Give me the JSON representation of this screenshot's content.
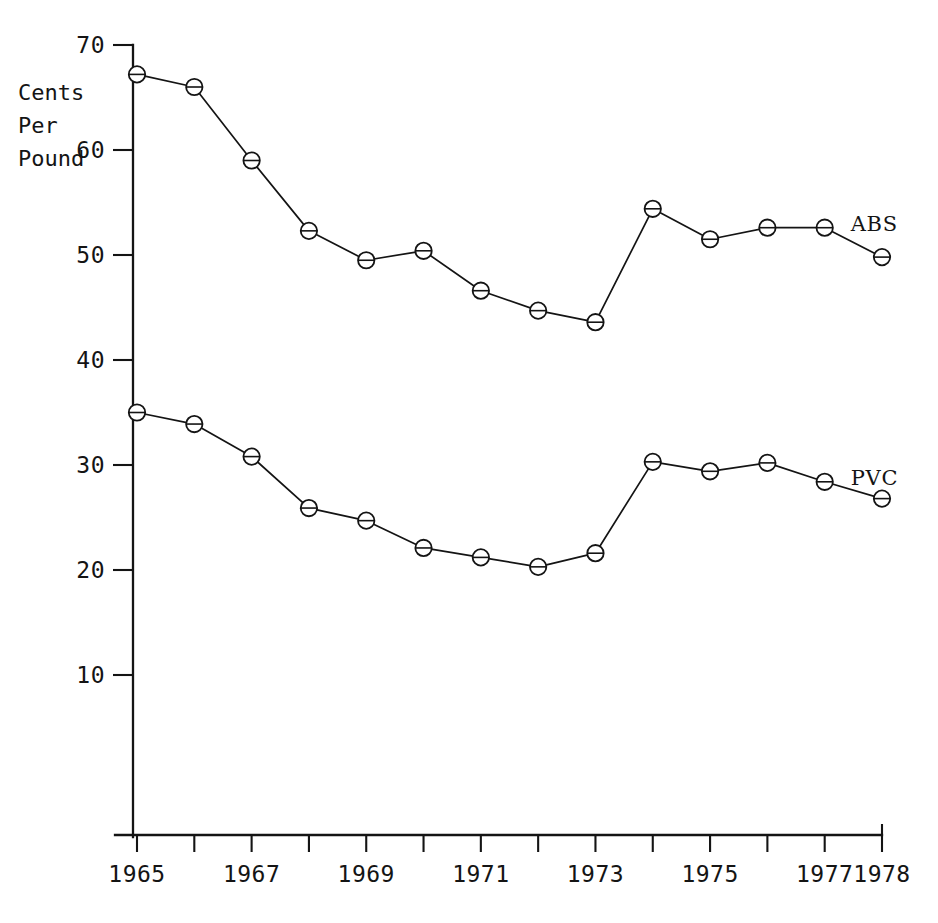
{
  "chart_data": {
    "type": "line",
    "title": "",
    "subtitle": "",
    "xlabel": "",
    "ylabel": "Cents Per Pound",
    "ylabel_lines": [
      "Cents",
      "Per",
      "Pound"
    ],
    "x": [
      1965,
      1966,
      1967,
      1968,
      1969,
      1970,
      1971,
      1972,
      1973,
      1974,
      1975,
      1976,
      1977,
      1978
    ],
    "xtick_labels": [
      "1965",
      "",
      "1967",
      "",
      "1969",
      "",
      "1971",
      "",
      "1973",
      "",
      "1975",
      "",
      "1977",
      "1978"
    ],
    "ytick_labels": [
      "10",
      "20",
      "30",
      "40",
      "50",
      "60",
      "70"
    ],
    "yticks": [
      10,
      20,
      30,
      40,
      50,
      60,
      70
    ],
    "ylim": [
      0,
      70
    ],
    "xlim": [
      1965,
      1978
    ],
    "grid": false,
    "legend_position": "inline-right",
    "series": [
      {
        "name": "ABS",
        "label": "ABS",
        "color": "#141414",
        "values": [
          67.2,
          66.0,
          59.0,
          52.3,
          49.5,
          50.4,
          46.6,
          44.7,
          43.6,
          54.4,
          51.5,
          52.6,
          52.6,
          49.8
        ]
      },
      {
        "name": "PVC",
        "label": "PVC",
        "color": "#141414",
        "values": [
          35.0,
          33.9,
          30.8,
          25.9,
          24.7,
          22.1,
          21.2,
          20.3,
          21.6,
          30.3,
          29.4,
          30.2,
          28.4,
          26.8
        ]
      }
    ],
    "annotations": []
  },
  "footer": {
    "caption": ""
  }
}
